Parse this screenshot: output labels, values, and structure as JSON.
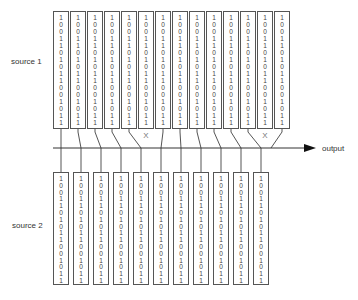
{
  "labels": {
    "source1": "source 1",
    "source2": "source 2",
    "output": "output",
    "discard_mark": "X"
  },
  "bit_sequence": [
    "1",
    "0",
    "0",
    "1",
    "1",
    "0",
    "1",
    "0",
    "1",
    "1",
    "0",
    "0",
    "1",
    "0",
    "1",
    "1"
  ],
  "source1": {
    "column_count": 14,
    "discarded_columns": [
      5,
      12
    ]
  },
  "source2": {
    "column_count": 11
  },
  "colors": {
    "stroke": "#555555",
    "box_fill": "#ffffff",
    "text": "#333333",
    "arrow": "#111111"
  }
}
